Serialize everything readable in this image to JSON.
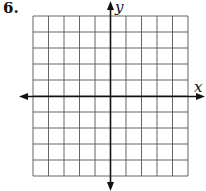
{
  "problem": {
    "number": "6."
  },
  "graph": {
    "x_axis_label": "x",
    "y_axis_label": "y",
    "grid": {
      "columns": 10,
      "rows": 10,
      "left": 33,
      "top": 16,
      "cell_w": 15.5,
      "cell_h": 16
    },
    "origin": {
      "x": 110.5,
      "y": 96.5
    },
    "colors": {
      "grid": "#555555",
      "axis": "#111111"
    }
  }
}
